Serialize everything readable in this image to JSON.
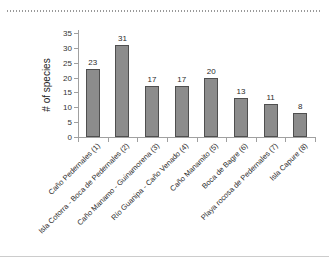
{
  "chart_data": {
    "type": "bar",
    "ylabel": "# of species",
    "xlabel": "",
    "categories": [
      "Caño Pedernales (1)",
      "Isla Cotorra - Boca de Pedernales (2)",
      "Caño Manamo - Guinamorena (3)",
      "Río Guanipa - Caño Venado (4)",
      "Caño Manamito (5)",
      "Boca de Bagre (6)",
      "Playa rocosa de Pedernales (7)",
      "Isla Capure (8)"
    ],
    "values": [
      23,
      31,
      17,
      17,
      20,
      13,
      11,
      8
    ],
    "data_labels": [
      "23",
      "31",
      "17",
      "17",
      "20",
      "13",
      "11",
      "8"
    ],
    "ylim": [
      0,
      35
    ],
    "yticks": [
      0,
      5,
      10,
      15,
      20,
      25,
      30,
      35
    ],
    "grid": false,
    "legend": "none",
    "bar_color": "#8c8c8c",
    "bar_border_color": "#4f4f4f",
    "axis_color": "#a0a0a0",
    "text_color": "#2b2b2b"
  }
}
